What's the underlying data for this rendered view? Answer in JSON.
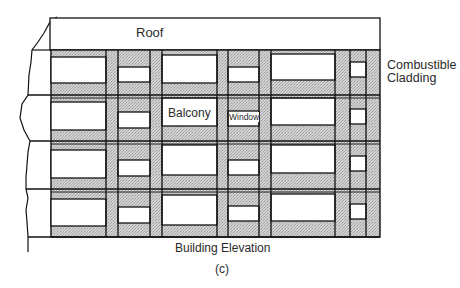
{
  "diagram": {
    "type": "building-elevation",
    "caption": "(c)",
    "title": "Building Elevation",
    "labels": {
      "roof": "Roof",
      "balcony": "Balcony",
      "window": "Window",
      "cladding_line1": "Combustible",
      "cladding_line2": "Cladding"
    },
    "colors": {
      "line": "#111111",
      "cladding_fill": "#c8c8c8",
      "opening_fill": "#ffffff"
    },
    "structure": {
      "floors": 4,
      "bays_per_floor": 6,
      "bay_pattern": [
        "balcony",
        "window",
        "balcony",
        "window",
        "balcony",
        "window"
      ]
    }
  }
}
